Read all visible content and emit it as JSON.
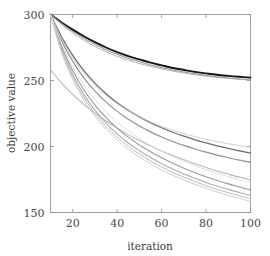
{
  "chart_data": {
    "type": "line",
    "title": "",
    "subtitle": "",
    "xlabel": "iteration",
    "ylabel": "objective value",
    "xlim": [
      10,
      100
    ],
    "ylim": [
      150,
      300
    ],
    "xticks": [
      20,
      40,
      60,
      80,
      100
    ],
    "yticks": [
      150,
      200,
      250,
      300
    ],
    "xtick_labels": [
      "20",
      "40",
      "60",
      "80",
      "100"
    ],
    "ytick_labels": [
      "150",
      "200",
      "250",
      "300"
    ],
    "grid": false,
    "legend": null,
    "legend_position": "none",
    "annotations": [],
    "x": [
      10,
      15,
      20,
      25,
      30,
      35,
      40,
      45,
      50,
      55,
      60,
      65,
      70,
      75,
      80,
      85,
      90,
      95,
      100
    ],
    "series": [
      {
        "name": "dark-primary",
        "color": "#151515",
        "width": 1.9,
        "opacity": 1.0,
        "values": [
          300,
          294,
          288.5,
          283.5,
          279,
          275,
          271.5,
          268.5,
          266,
          263.5,
          261.5,
          259.5,
          258,
          256.5,
          255.4,
          254.4,
          253.5,
          252.8,
          252.2
        ]
      },
      {
        "name": "gray-upper-a",
        "color": "#8f8f8f",
        "width": 1.1,
        "opacity": 0.95,
        "values": [
          300,
          293.2,
          287.2,
          282,
          277.4,
          273.3,
          269.8,
          266.8,
          264.2,
          261.8,
          259.8,
          258,
          256.4,
          255,
          253.8,
          252.8,
          251.9,
          251.1,
          250.5
        ]
      },
      {
        "name": "gray-upper-b",
        "color": "#a8a8a8",
        "width": 1.0,
        "opacity": 0.9,
        "values": [
          300,
          292.5,
          286,
          280.5,
          275.8,
          271.8,
          268.3,
          265.4,
          262.9,
          260.7,
          258.8,
          257.1,
          255.7,
          254.4,
          253.3,
          252.4,
          251.6,
          250.9,
          250.3
        ]
      },
      {
        "name": "gray-mid-steep",
        "color": "#6e6e6e",
        "width": 1.3,
        "opacity": 1.0,
        "values": [
          300,
          283,
          269,
          257.5,
          248,
          240,
          233.2,
          227.4,
          222.4,
          218,
          214.2,
          210.8,
          207.8,
          205.1,
          202.7,
          200.5,
          198.5,
          196.7,
          195.1
        ]
      },
      {
        "name": "gray-mid-trail",
        "color": "#8b8b8b",
        "width": 1.2,
        "opacity": 0.95,
        "values": [
          300,
          280,
          264.5,
          252,
          242,
          233.6,
          226.6,
          220.6,
          215.5,
          211.1,
          207.2,
          203.8,
          200.8,
          198.1,
          195.7,
          193.5,
          191.5,
          189.7,
          188.1
        ]
      },
      {
        "name": "light-shallow-tail",
        "color": "#c9c9c9",
        "width": 1.0,
        "opacity": 0.9,
        "values": [
          300,
          281.5,
          267,
          255.5,
          246.3,
          238.7,
          232.4,
          227.1,
          222.6,
          218.7,
          215.3,
          212.4,
          209.8,
          207.5,
          205.5,
          203.7,
          202.1,
          200.6,
          199.3
        ]
      },
      {
        "name": "light-early-low",
        "color": "#b4b4b4",
        "width": 1.1,
        "opacity": 0.95,
        "values": [
          258,
          248,
          239.5,
          232,
          225.3,
          219.3,
          213.9,
          209,
          204.5,
          200.4,
          196.6,
          193.1,
          189.9,
          186.9,
          184.1,
          181.5,
          179.1,
          176.8,
          174.7
        ]
      },
      {
        "name": "bundle-a",
        "color": "#9a9a9a",
        "width": 1.1,
        "opacity": 1.0,
        "values": [
          300,
          276,
          257.5,
          243,
          231.4,
          221.9,
          213.9,
          207.1,
          201.2,
          196,
          191.4,
          187.3,
          183.6,
          180.2,
          177.1,
          174.3,
          171.7,
          169.3,
          167.1
        ]
      },
      {
        "name": "bundle-b",
        "color": "#aeaeae",
        "width": 1.1,
        "opacity": 1.0,
        "values": [
          300,
          274,
          254.5,
          239.5,
          227.5,
          217.7,
          209.6,
          202.7,
          196.8,
          191.6,
          187,
          182.9,
          179.2,
          175.9,
          172.8,
          170,
          167.5,
          165.1,
          162.9
        ]
      },
      {
        "name": "bundle-c",
        "color": "#bdbdbd",
        "width": 1.0,
        "opacity": 1.0,
        "values": [
          300,
          272.5,
          252.5,
          237.3,
          225.2,
          215.3,
          207.1,
          200.2,
          194.3,
          189.1,
          184.5,
          180.4,
          176.7,
          173.4,
          170.3,
          167.5,
          165,
          162.6,
          160.4
        ]
      },
      {
        "name": "bundle-d",
        "color": "#cfcfcf",
        "width": 1.0,
        "opacity": 1.0,
        "values": [
          300,
          271,
          250.5,
          235.1,
          223,
          213,
          204.8,
          197.9,
          192,
          186.9,
          182.3,
          178.3,
          174.6,
          171.3,
          168.3,
          165.5,
          163,
          160.7,
          158.5
        ]
      },
      {
        "name": "bundle-e",
        "color": "#dcdcdc",
        "width": 0.9,
        "opacity": 1.0,
        "values": [
          300,
          278,
          260.5,
          246.8,
          235.6,
          226.3,
          218.5,
          211.8,
          206,
          200.9,
          196.4,
          192.4,
          188.8,
          185.5,
          182.5,
          179.7,
          177.2,
          174.8,
          172.6
        ]
      }
    ]
  },
  "axes": {
    "left_title": "objective value",
    "bottom_title": "iteration"
  }
}
